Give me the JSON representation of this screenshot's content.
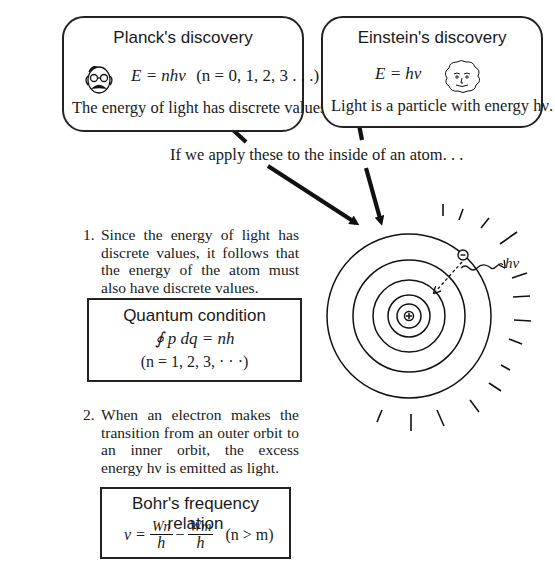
{
  "planck": {
    "title": "Planck's discovery",
    "formula": "E = nhν",
    "formula_condition": "(n = 0, 1, 2, 3 . . .)",
    "caption": "The energy of light has discrete values.",
    "portrait_icon": "planck-portrait-icon"
  },
  "einstein": {
    "title": "Einstein's discovery",
    "formula": "E = hν",
    "caption": "Light is a particle with energy hν.",
    "portrait_icon": "einstein-portrait-icon"
  },
  "bridge_text": "If we apply these to the inside of an atom. . .",
  "items": [
    {
      "number": "1.",
      "text": "Since the energy of light has discrete values, it follows that the energy of the atom must also have discrete values."
    },
    {
      "number": "2.",
      "text": "When an electron makes the transition from an outer orbit to an inner orbit, the excess energy hν is emitted as light."
    }
  ],
  "quantum_condition": {
    "title": "Quantum condition",
    "formula": "∮ p dq = nh",
    "condition": "(n = 1, 2, 3, · · ·)"
  },
  "bohr_relation": {
    "title": "Bohr's frequency relation",
    "lhs": "ν =",
    "term1_num": "Wn",
    "term1_den": "h",
    "minus": "−",
    "term2_num": "Wm",
    "term2_den": "h",
    "condition": "(n > m)"
  },
  "atom": {
    "photon_label": "hν",
    "nucleus_symbol": "⊕",
    "electron_symbol": "⊖",
    "orbit_count": 5
  }
}
